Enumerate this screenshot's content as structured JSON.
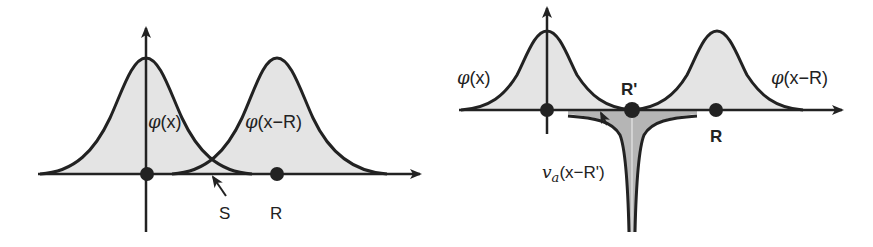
{
  "colors": {
    "stroke": "#222222",
    "fill_light": "#e4e4e4",
    "fill_dark": "#b5b5b5",
    "background": "#ffffff"
  },
  "left_panel": {
    "phi_symbol": "φ",
    "curve1_label_rest": "(x)",
    "curve2_label_rest": "(x−R)",
    "overlap_label": "S",
    "point_label": "R"
  },
  "right_panel": {
    "phi_symbol": "φ",
    "curve1_label_rest": "(x)",
    "curve2_label_rest": "(x−R)",
    "midpoint_label": "R'",
    "point_label": "R",
    "potential_symbol": "v",
    "potential_subscript": "a",
    "potential_label_rest": "(x−R')"
  }
}
